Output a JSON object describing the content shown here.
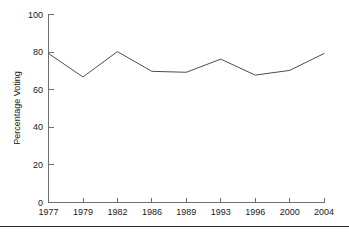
{
  "chart_data": {
    "type": "line",
    "title": "",
    "subtitle": "",
    "xlabel": "",
    "ylabel": "Percentage Voting",
    "categories": [
      "1977",
      "1979",
      "1982",
      "1986",
      "1989",
      "1993",
      "1996",
      "2000",
      "2004"
    ],
    "values": [
      79,
      66.5,
      80,
      69.5,
      69,
      76,
      67.5,
      70,
      79
    ],
    "series": [
      {
        "name": "Percentage Voting",
        "values": [
          79,
          66.5,
          80,
          69.5,
          69,
          76,
          67.5,
          70,
          79
        ]
      }
    ],
    "ylim": [
      0,
      100
    ],
    "yticks": [
      0,
      20,
      40,
      60,
      80,
      100
    ],
    "ytick_labels": [
      "0",
      "20",
      "40",
      "60",
      "80",
      "100"
    ],
    "xtick_labels": [
      "1977",
      "1979",
      "1982",
      "1986",
      "1989",
      "1993",
      "1996",
      "2000",
      "2004"
    ],
    "grid": false,
    "legend": false,
    "legend_position": "none",
    "line_color": "#4d4d4d",
    "axis_color": "#6e6e6e",
    "text_color": "#1a1a1a",
    "background_color": "#ffffff"
  },
  "axes": {
    "y_title": "Percentage Voting",
    "y_ticks": [
      {
        "label": "100",
        "value": 100
      },
      {
        "label": "80",
        "value": 80
      },
      {
        "label": "60",
        "value": 60
      },
      {
        "label": "40",
        "value": 40
      },
      {
        "label": "20",
        "value": 20
      },
      {
        "label": "0",
        "value": 0
      }
    ],
    "x_ticks": [
      {
        "label": "1977"
      },
      {
        "label": "1979"
      },
      {
        "label": "1982"
      },
      {
        "label": "1986"
      },
      {
        "label": "1989"
      },
      {
        "label": "1993"
      },
      {
        "label": "1996"
      },
      {
        "label": "2000"
      },
      {
        "label": "2004"
      }
    ]
  }
}
